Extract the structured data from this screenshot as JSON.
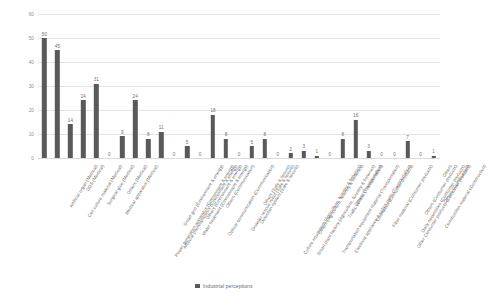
{
  "chart_data": {
    "type": "bar",
    "title": "",
    "xlabel": "",
    "ylabel": "",
    "ylim": [
      0,
      60
    ],
    "yticks": [
      0,
      10,
      20,
      30,
      40,
      50,
      60
    ],
    "grid": true,
    "legend_position": "bottom",
    "series_name": "Industrial perceptions",
    "bar_color": "#595959",
    "categories": [
      "Artificial organ (Medical)",
      "Cell culture material (Medical)",
      "DDS (Medical)",
      "Surgical glue (Medical)",
      "Medical apparatus (Medical)",
      "Others (Medical)",
      "Power generation apparatus (Environment & energy)",
      "Artificial photosynthesis (Environment & energy)",
      "Smart grid (Environment & energy)",
      "Water treatment (Environment & energy)",
      "Others (Environment & energy)",
      "Optical communication (Communication)",
      "Others (Communication)",
      "Disaster rescue robot (Safe & secure)",
      "Detection system (Safe & secure)",
      "Others (Safe & secure)",
      "Culture equipment (Agriculture, forestry & fisheries)",
      "Smart plant factory (Agriculture, forestry & fisheries)",
      "Others (Agriculture, forestry & fisheries)",
      "Transportation equipment material (Transportation)",
      "Electrical appliance & optics parts (Transportation)",
      "Traffic control (Transportation)",
      "Others (Transportation)",
      "Cosmetics (Consumer products)",
      "Fiber material (Consumer products)",
      "Other Consumer products (Consumer products)",
      "Daily necessities (Consumer products)",
      "Others (Consumer products)",
      "Construction material (Construction)",
      "Others (Construction)",
      "Others"
    ],
    "values": [
      50,
      45,
      14,
      24,
      31,
      0,
      9,
      24,
      8,
      11,
      0,
      5,
      0,
      18,
      8,
      0,
      5,
      8,
      0,
      2,
      3,
      1,
      0,
      8,
      16,
      3,
      0,
      0,
      7,
      0,
      1
    ]
  },
  "legend": {
    "label": "Industrial perceptions"
  }
}
